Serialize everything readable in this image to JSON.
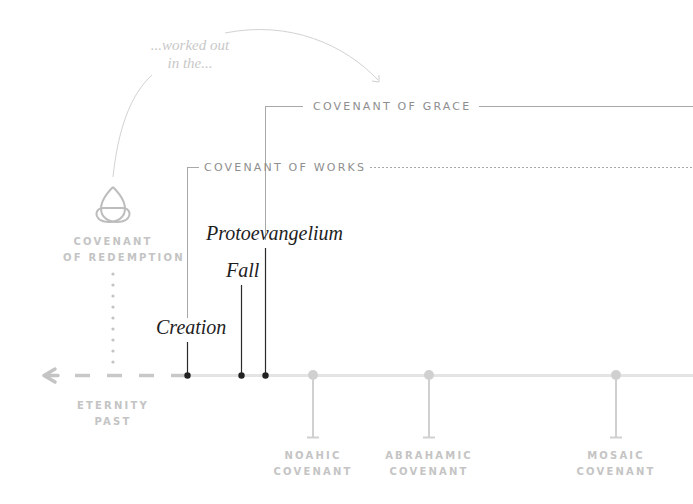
{
  "annotation": {
    "line1": "...worked out",
    "line2": "in the..."
  },
  "covenants_top": {
    "grace": "COVENANT OF GRACE",
    "works": "COVENANT OF WORKS"
  },
  "redemption": {
    "icon": "triquetra-icon",
    "line1": "COVENANT",
    "line2": "OF REDEMPTION"
  },
  "events": {
    "protoevangelium": "Protoevangelium",
    "fall": "Fall",
    "creation": "Creation"
  },
  "eternity": {
    "line1": "ETERNITY",
    "line2": "PAST",
    "icon": "arrow-left-icon"
  },
  "timeline_covenants": [
    {
      "line1": "NOAHIC",
      "line2": "COVENANT"
    },
    {
      "line1": "ABRAHAMIC",
      "line2": "COVENANT"
    },
    {
      "line1": "MOSAIC",
      "line2": "COVENANT"
    }
  ],
  "colors": {
    "dark": "#1e1e1e",
    "mid_gray": "#8e8e8e",
    "light_gray": "#c4c4c4",
    "timeline": "#e4e4e4"
  }
}
